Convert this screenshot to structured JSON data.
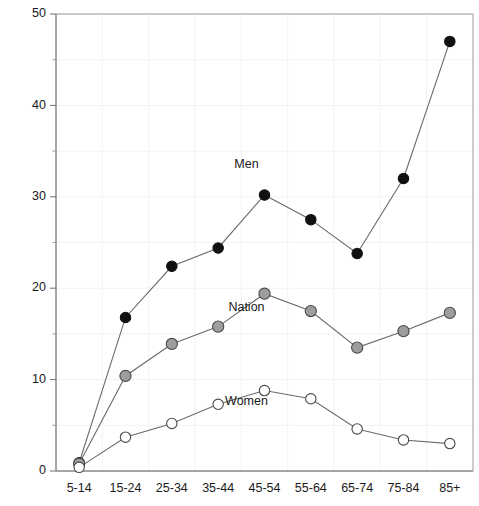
{
  "chart_data": {
    "type": "line",
    "title": "",
    "subtitle": "",
    "xlabel": "",
    "ylabel": "",
    "categories": [
      "5-14",
      "15-24",
      "25-34",
      "35-44",
      "45-54",
      "55-64",
      "65-74",
      "75-84",
      "85+"
    ],
    "ylim": [
      0,
      50
    ],
    "xlim_categories": 9,
    "y_ticks_major": [
      0,
      10,
      20,
      30,
      40,
      50
    ],
    "y_ticks_major_labels": [
      "0",
      "10",
      "20",
      "30",
      "40",
      "50"
    ],
    "y_ticks_minor": [
      5,
      15,
      25,
      35,
      45
    ],
    "grid": true,
    "grid_color": "#f2f2f2",
    "legend": "inline-labels",
    "series": [
      {
        "name": "Men",
        "marker": "filled-circle",
        "color": "#101010",
        "label_x_category": "45-54",
        "label_value": 33.2,
        "values": [
          0.9,
          16.8,
          22.4,
          24.4,
          30.2,
          27.5,
          23.8,
          32.0,
          47.0
        ]
      },
      {
        "name": "Nation",
        "marker": "gray-circle",
        "color": "#9d9d9d",
        "label_x_category": "45-54",
        "label_value": 17.5,
        "values": [
          0.8,
          10.4,
          13.9,
          15.8,
          19.4,
          17.5,
          13.5,
          15.3,
          17.3
        ]
      },
      {
        "name": "Women",
        "marker": "open-circle",
        "color": "#ffffff",
        "label_x_category": "45-54",
        "label_value": 7.2,
        "values": [
          0.4,
          3.7,
          5.2,
          7.3,
          8.8,
          7.9,
          4.6,
          3.4,
          3.0
        ]
      }
    ],
    "annotations": [
      {
        "text": "Men",
        "category": "45-54",
        "value": 33.2
      },
      {
        "text": "Nation",
        "category": "45-54",
        "value": 17.5
      },
      {
        "text": "Women",
        "category": "45-54",
        "value": 7.2
      }
    ]
  }
}
